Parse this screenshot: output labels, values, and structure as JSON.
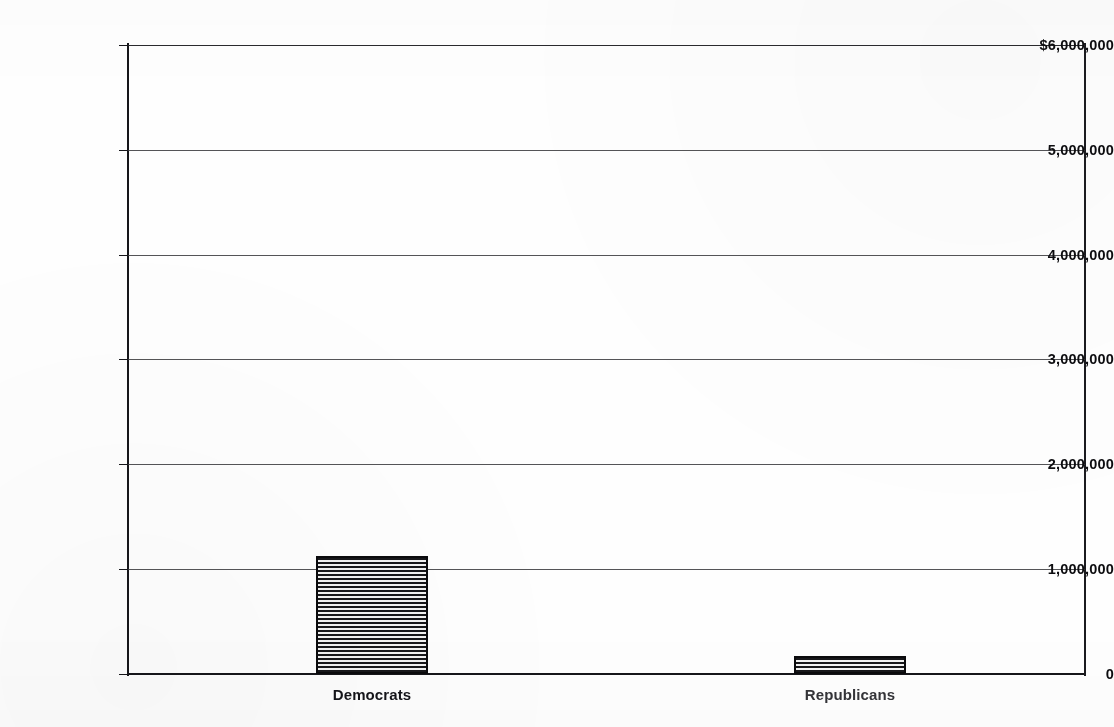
{
  "chart_data": {
    "type": "bar",
    "title": "",
    "subtitle": "",
    "xlabel": "",
    "ylabel": "",
    "categories": [
      "Democrats",
      "Republicans"
    ],
    "values": [
      1130000,
      170000
    ],
    "series": [
      {
        "name": "Contributions",
        "values": [
          1130000,
          170000
        ]
      }
    ],
    "ylim": [
      0,
      6000000
    ],
    "ytick_values": [
      6000000,
      5000000,
      4000000,
      3000000,
      2000000,
      1000000,
      0
    ],
    "ytick_labels": [
      "$6,000,000",
      "5,000,000",
      "4,000,000",
      "3,000,000",
      "2,000,000",
      "1,000,000",
      "0"
    ],
    "grid": true,
    "grid_axis": "y",
    "legend": false,
    "legend_position": "none",
    "annotations": [],
    "bar_fill": "horizontal-line-hatch",
    "bar_outline_color": "#0b0b0d",
    "bar_hatch_color": "#17171a",
    "axis_color": "#16161a",
    "grid_color": "#3c3c40",
    "background_color": "#fefefe",
    "text_color": "#0d0d10"
  },
  "bars": [
    {
      "category": "Democrats",
      "value": 1130000,
      "value_label": "",
      "left_px": 316,
      "width_px": 112,
      "top_px": 549
    },
    {
      "category": "Republicans",
      "value": 170000,
      "value_label": "",
      "left_px": 794,
      "width_px": 112,
      "top_px": 656
    }
  ],
  "axis": {
    "y_ticks": [
      {
        "label": "$6,000,000",
        "value": 6000000,
        "y_px": 45
      },
      {
        "label": "5,000,000",
        "value": 5000000,
        "y_px": 150
      },
      {
        "label": "4,000,000",
        "value": 4000000,
        "y_px": 255
      },
      {
        "label": "3,000,000",
        "value": 3000000,
        "y_px": 359
      },
      {
        "label": "2,000,000",
        "value": 2000000,
        "y_px": 464
      },
      {
        "label": "1,000,000",
        "value": 1000000,
        "y_px": 569
      },
      {
        "label": "0",
        "value": 0,
        "y_px": 674
      }
    ],
    "x_categories": [
      {
        "label": "Democrats",
        "center_px": 372
      },
      {
        "label": "Republicans",
        "center_px": 850
      }
    ]
  }
}
